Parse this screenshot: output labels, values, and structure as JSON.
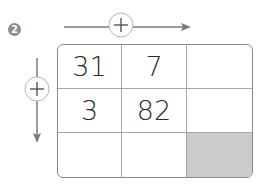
{
  "problem_number": "2",
  "operators": {
    "horizontal": "+",
    "vertical": "+"
  },
  "grid": {
    "rows": [
      [
        "31",
        "7",
        ""
      ],
      [
        "3",
        "82",
        ""
      ],
      [
        "",
        "",
        ""
      ]
    ],
    "shaded_cell": [
      2,
      2
    ],
    "shade_color": "#cccccc"
  }
}
